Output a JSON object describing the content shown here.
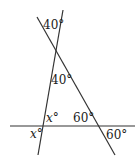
{
  "diagram": {
    "type": "geometry-angles",
    "lines": [
      {
        "name": "line-a",
        "x1": 63,
        "y1": 10,
        "x2": 38,
        "y2": 155
      },
      {
        "name": "line-b",
        "x1": 37,
        "y1": 17,
        "x2": 115,
        "y2": 155
      },
      {
        "name": "horizontal-line",
        "x1": 10,
        "y1": 126,
        "x2": 135,
        "y2": 126
      }
    ],
    "labels": {
      "top_angle": "40°",
      "middle_angle": "40°",
      "x_upper": "x",
      "x_upper_deg": "°",
      "x_lower": "x",
      "x_lower_deg": "°",
      "right_inner": "60°",
      "right_outer": "60°"
    }
  }
}
